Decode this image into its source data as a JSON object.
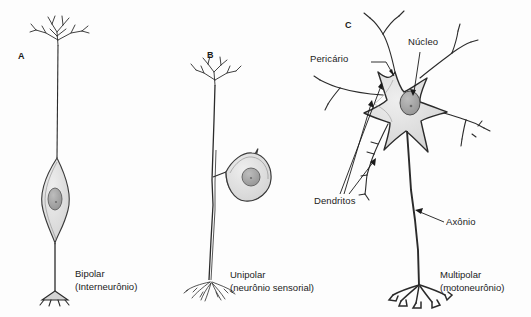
{
  "figure": {
    "title_text": "",
    "background_color": "#fdfdfd",
    "ink_color": "#1a1a1a",
    "soma_fill_color": "#d9d9d9",
    "nucleus_fill_color": "#a8a8a8",
    "width": 531,
    "height": 317
  },
  "panels": [
    {
      "letter": "A",
      "type": "bipolar",
      "caption_name": "Bipolar",
      "caption_sub": "(Interneurônio)"
    },
    {
      "letter": "B",
      "type": "unipolar",
      "caption_name": "Unipolar",
      "caption_sub": "(neurônio sensorial)"
    },
    {
      "letter": "C",
      "type": "multipolar",
      "caption_name": "Multipolar",
      "caption_sub": "(motoneurônio)"
    }
  ],
  "annotations": {
    "pericario": "Pericário",
    "nucleo": "Núcleo",
    "dendritos": "Dendritos",
    "axonio": "Axônio"
  }
}
